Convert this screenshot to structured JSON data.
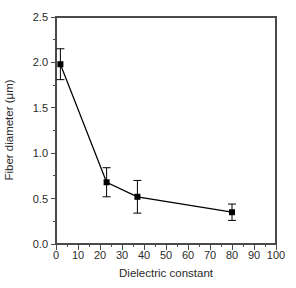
{
  "figure": {
    "background": "#ffffff",
    "frame_color": "#4a4a4a",
    "tick_color": "#4a4a4a",
    "data_color": "#000000",
    "text_color": "#2b2b2b"
  },
  "chart_data": {
    "type": "line",
    "subtype": "scatter-line-with-error-bars",
    "title": "",
    "xlabel": "Dielectric constant",
    "ylabel": "Fiber diameter (μm)",
    "xlim": [
      0,
      100
    ],
    "ylim": [
      0.0,
      2.5
    ],
    "grid": false,
    "legend": null,
    "x_tick_values": [
      0,
      10,
      20,
      30,
      40,
      50,
      60,
      70,
      80,
      90,
      100
    ],
    "x_tick_labels": [
      "0",
      "10",
      "20",
      "30",
      "40",
      "50",
      "60",
      "70",
      "80",
      "90",
      "100"
    ],
    "x_minor_step": 5,
    "y_tick_values": [
      0.0,
      0.5,
      1.0,
      1.5,
      2.0,
      2.5
    ],
    "y_tick_labels": [
      "0.0",
      "0.5",
      "1.0",
      "1.5",
      "2.0",
      "2.5"
    ],
    "y_minor_step": 0.25,
    "series": [
      {
        "name": "fiber-diameter",
        "marker": "filled-square",
        "line_style": "solid",
        "points": [
          {
            "x": 2,
            "y": 1.98,
            "yerr": 0.17
          },
          {
            "x": 23,
            "y": 0.68,
            "yerr": 0.16
          },
          {
            "x": 37,
            "y": 0.52,
            "yerr": 0.18
          },
          {
            "x": 80,
            "y": 0.35,
            "yerr": 0.09
          }
        ]
      }
    ]
  }
}
